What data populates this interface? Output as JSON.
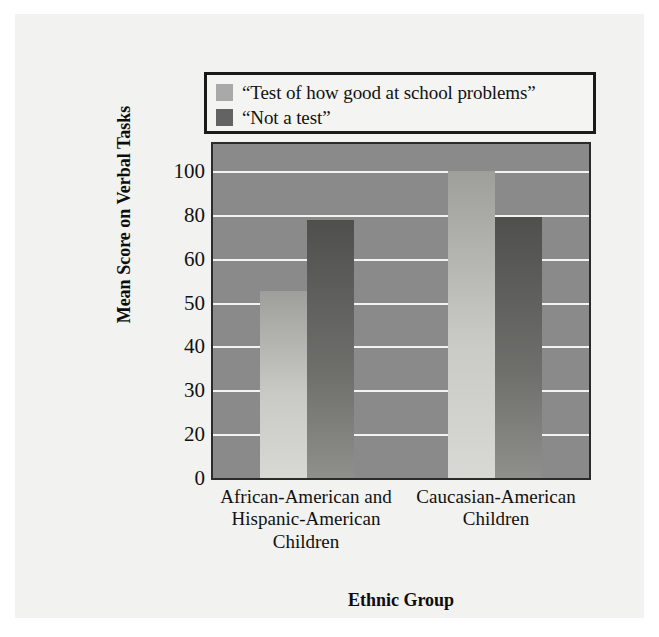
{
  "chart_data": {
    "type": "bar",
    "title": "",
    "xlabel": "Ethnic Group",
    "ylabel": "Mean Score on Verbal Tasks",
    "categories": [
      "African-American and Hispanic-American Children",
      "Caucasian-American Children"
    ],
    "category_lines": [
      [
        "African-American and",
        "Hispanic-American",
        "Children"
      ],
      [
        "Caucasian-American",
        "Children"
      ]
    ],
    "series": [
      {
        "name": "“Test of how good at school problems”",
        "color": "#a9a9a9",
        "values": [
          61,
          100
        ]
      },
      {
        "name": "“Not a test”",
        "color": "#636363",
        "values": [
          84,
          85
        ]
      }
    ],
    "ytick_labels": [
      "100",
      "80",
      "60",
      "50",
      "40",
      "30",
      "20",
      "0"
    ],
    "ytick_values": [
      100,
      80,
      60,
      50,
      40,
      30,
      20,
      0
    ],
    "ylim": [
      0,
      110
    ],
    "grid": true,
    "grid_color": "#f3f3f3",
    "plot_background": "#8a8a8a",
    "legend_position": "above-plot-boxed"
  },
  "legend": {
    "items": [
      {
        "label": "“Test of how good at school problems”",
        "swatch": "#a9a9a9"
      },
      {
        "label": "“Not a test”",
        "swatch": "#636363"
      }
    ]
  },
  "axes": {
    "y_title": "Mean Score on Verbal Tasks",
    "x_title": "Ethnic Group"
  }
}
